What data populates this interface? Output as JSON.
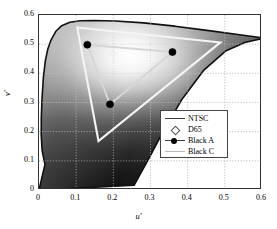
{
  "chart_data": {
    "type": "scatter",
    "title": "",
    "xlabel": "u'",
    "ylabel": "v'",
    "xlim": [
      0,
      0.6
    ],
    "ylim": [
      0,
      0.6
    ],
    "xticks": [
      "0",
      "0.1",
      "0.2",
      "0.3",
      "0.4",
      "0.5",
      "0.6"
    ],
    "yticks": [
      "0",
      "0.1",
      "0.2",
      "0.3",
      "0.4",
      "0.5",
      "0.6"
    ],
    "xtick_values": [
      0,
      0.1,
      0.2,
      0.3,
      0.4,
      0.5,
      0.6
    ],
    "ytick_values": [
      0,
      0.1,
      0.2,
      0.3,
      0.4,
      0.5,
      0.6
    ],
    "grid": true,
    "legend_position": "lower right",
    "legend": [
      {
        "label": "NTSC",
        "marker": "line",
        "color": "#3a3a3a"
      },
      {
        "label": "D65",
        "marker": "diamond-open",
        "color": "#555555"
      },
      {
        "label": "Black A",
        "marker": "line-filled-circle",
        "color": "#000000"
      },
      {
        "label": "Black C",
        "marker": "line",
        "color": "#b9b9b9"
      }
    ],
    "series": [
      {
        "name": "CIE 1976 u'v' spectral locus",
        "type": "filled-region",
        "fill": "grayscale-gradient",
        "outline_color": "#111111",
        "points": [
          [
            0.0,
            0.0
          ],
          [
            0.2557,
            0.0162
          ],
          [
            0.299,
            0.1161
          ],
          [
            0.3324,
            0.1968
          ],
          [
            0.3833,
            0.3083
          ],
          [
            0.4428,
            0.41
          ],
          [
            0.5019,
            0.4764
          ],
          [
            0.5535,
            0.5057
          ],
          [
            0.5924,
            0.5166
          ],
          [
            0.6168,
            0.519
          ],
          [
            0.5401,
            0.5321
          ],
          [
            0.452,
            0.5473
          ],
          [
            0.3657,
            0.5617
          ],
          [
            0.281,
            0.573
          ],
          [
            0.206,
            0.5792
          ],
          [
            0.1483,
            0.581
          ],
          [
            0.1106,
            0.5801
          ],
          [
            0.083,
            0.5752
          ],
          [
            0.0611,
            0.5633
          ],
          [
            0.0453,
            0.5442
          ],
          [
            0.0326,
            0.515
          ],
          [
            0.0235,
            0.4823
          ],
          [
            0.0172,
            0.4446
          ],
          [
            0.0119,
            0.3871
          ],
          [
            0.0082,
            0.316
          ],
          [
            0.0062,
            0.2468
          ],
          [
            0.006,
            0.188
          ],
          [
            0.0085,
            0.1339
          ],
          [
            0.0161,
            0.0877
          ]
        ]
      },
      {
        "name": "NTSC",
        "type": "polygon-outline",
        "color": "#2a2a2a",
        "points": [
          [
            0.0,
            0.0
          ],
          [
            0.0,
            0.0
          ],
          [
            0.0,
            0.0
          ]
        ]
      },
      {
        "name": "Black A",
        "type": "triangle-with-markers",
        "color": "#d8d8d8",
        "marker": "filled-circle",
        "marker_color": "#000000",
        "vertices": [
          {
            "u": 0.13,
            "v": 0.498,
            "name": "green-primary"
          },
          {
            "u": 0.359,
            "v": 0.473,
            "name": "red-primary"
          },
          {
            "u": 0.191,
            "v": 0.294,
            "name": "blue-primary"
          }
        ]
      },
      {
        "name": "Black C",
        "type": "triangle-outline",
        "color": "#f2f2f2",
        "vertices": [
          {
            "u": 0.103,
            "v": 0.557,
            "name": "green-primary"
          },
          {
            "u": 0.488,
            "v": 0.506,
            "name": "red-primary"
          },
          {
            "u": 0.16,
            "v": 0.168,
            "name": "blue-primary"
          }
        ]
      },
      {
        "name": "D65",
        "type": "point",
        "marker": "diamond-open",
        "color": "#f0f0f0",
        "points": [
          {
            "u": 0.1978,
            "v": 0.4683
          }
        ]
      }
    ]
  }
}
